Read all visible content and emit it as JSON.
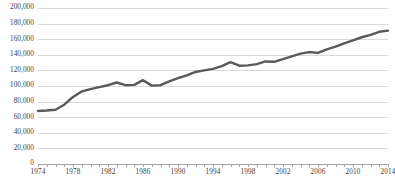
{
  "chart_data": {
    "type": "line",
    "title": "",
    "subtitle": "",
    "xlabel": "",
    "ylabel": "",
    "grid": "horizontal",
    "legend": "none",
    "xlim": [
      1974,
      2014
    ],
    "ylim": [
      0,
      200000
    ],
    "y_tick_step": 20000,
    "x_tick_step": 1,
    "x_label_step": 4,
    "line_color": "#595959",
    "gridline_color": "#d9d9d9",
    "axis_color": "#a6a6a6",
    "background_color": "#ffffff",
    "y_tick_labels": [
      "200,000",
      "180,000",
      "160,000",
      "140,000",
      "120,000",
      "100,000",
      "80,000",
      "60,000",
      "40,000",
      "20,000",
      "0"
    ],
    "y_tick_values": [
      200000,
      180000,
      160000,
      140000,
      120000,
      100000,
      80000,
      60000,
      40000,
      20000,
      0
    ],
    "x_tick_labels": [
      "1974",
      "1978",
      "1982",
      "1986",
      "1990",
      "1994",
      "1998",
      "2002",
      "2006",
      "2010",
      "2014"
    ],
    "x_tick_values": [
      1974,
      1978,
      1982,
      1986,
      1990,
      1994,
      1998,
      2002,
      2006,
      2010,
      2014
    ],
    "x": [
      1974,
      1975,
      1976,
      1977,
      1978,
      1979,
      1980,
      1981,
      1982,
      1983,
      1984,
      1985,
      1986,
      1987,
      1988,
      1989,
      1990,
      1991,
      1992,
      1993,
      1994,
      1995,
      1996,
      1997,
      1998,
      1999,
      2000,
      2001,
      2002,
      2003,
      2004,
      2005,
      2006,
      2007,
      2008,
      2009,
      2010,
      2011,
      2012,
      2013,
      2014
    ],
    "series": [
      {
        "name": "Value",
        "values": [
          68000,
          68500,
          69500,
          76000,
          86000,
          93000,
          96000,
          98500,
          101000,
          104500,
          101000,
          101500,
          107500,
          100500,
          101000,
          106000,
          110000,
          113500,
          118000,
          120000,
          122000,
          125500,
          130500,
          126000,
          126500,
          128000,
          131500,
          131000,
          134500,
          138000,
          141500,
          143500,
          142500,
          147000,
          150500,
          154500,
          158500,
          162500,
          165500,
          169500,
          171000
        ]
      }
    ]
  }
}
